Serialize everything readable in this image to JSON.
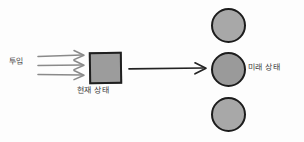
{
  "diagram": {
    "background_color": "#fdfdfd",
    "labels": {
      "input": "투입",
      "current_state": "현재 상태",
      "future_state": "미래 상태"
    },
    "shapes": {
      "current_state_box": {
        "kind": "square",
        "fill": "#9c9c9c",
        "stroke": "#1f1f1f"
      },
      "future_state_nodes": [
        {
          "kind": "circle",
          "fill": "#a8a8a8",
          "stroke": "#1c1c1c",
          "position": "top"
        },
        {
          "kind": "circle",
          "fill": "#9a9a9a",
          "stroke": "#1c1c1c",
          "position": "middle"
        },
        {
          "kind": "circle",
          "fill": "#a8a8a8",
          "stroke": "#1c1c1c",
          "position": "bottom"
        }
      ]
    },
    "connectors": {
      "input_arrows_count": 3,
      "input_arrow_color": "#8a8a8a",
      "transition_arrow_color": "#232323"
    }
  }
}
